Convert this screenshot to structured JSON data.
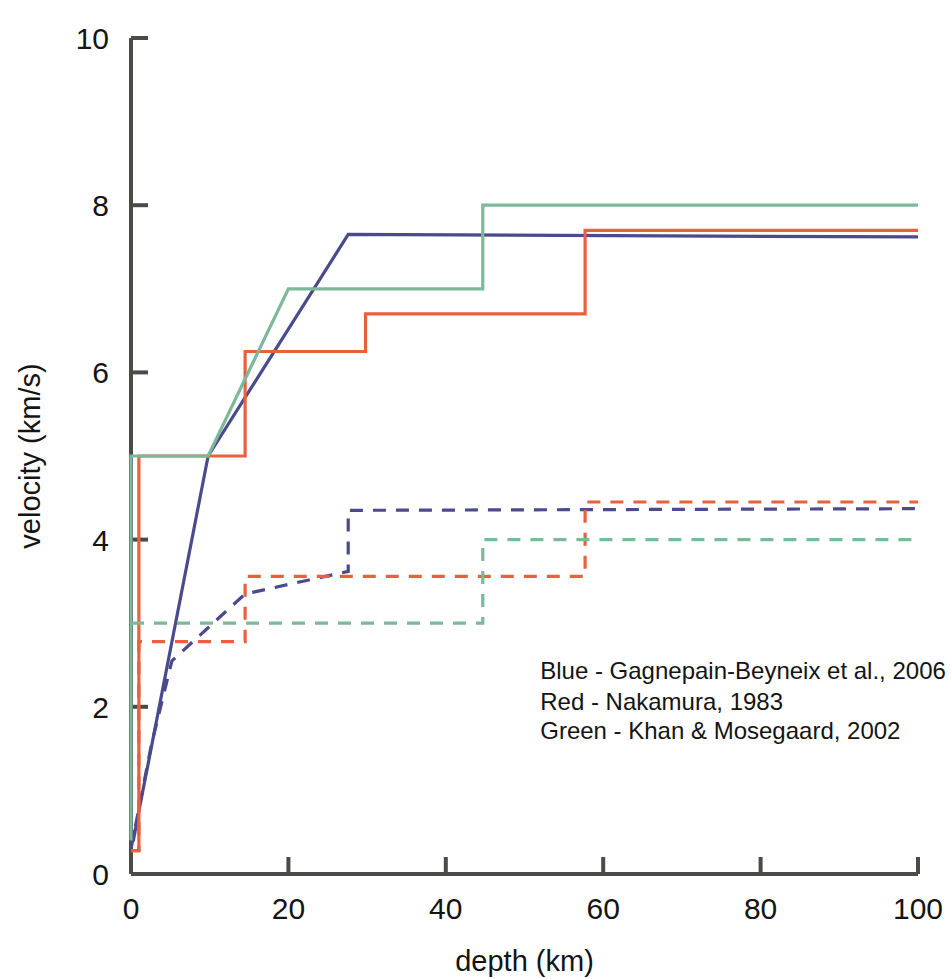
{
  "chart_data": {
    "type": "line",
    "title": "",
    "xlabel": "depth (km)",
    "ylabel": "velocity (km/s)",
    "xlim": [
      0,
      100
    ],
    "ylim": [
      0,
      10
    ],
    "xticks": [
      0,
      20,
      40,
      60,
      80,
      100
    ],
    "yticks": [
      0,
      2,
      4,
      6,
      8,
      10
    ],
    "xtick_labels": [
      "0",
      "20",
      "40",
      "60",
      "80",
      "100"
    ],
    "ytick_labels": [
      "0",
      "2",
      "4",
      "6",
      "8",
      "10"
    ],
    "grid": false,
    "legend_position": "inside-lower-right",
    "colors": {
      "blue": "#4a4a8c",
      "red": "#e8603c",
      "green": "#7cb899",
      "axis": "#4a4a46",
      "text": "#141414"
    },
    "annotations": [
      {
        "name": "legend-blue",
        "text": "Blue - Gagnepain-Beyneix et al., 2006",
        "color": "#4a4a8c",
        "x": 52,
        "y": 2.33
      },
      {
        "name": "legend-red",
        "text": "Red - Nakamura, 1983",
        "color": "#e8603c",
        "x": 52,
        "y": 1.96
      },
      {
        "name": "legend-green",
        "text": "Green - Khan & Mosegaard, 2002",
        "color": "#7cb899",
        "x": 52,
        "y": 1.62
      }
    ],
    "series": [
      {
        "name": "Gagnepain-Beyneix et al., 2006 (P-wave)",
        "short": "blue-p-solid",
        "color": "#4a4a8c",
        "dash": "solid",
        "width": 3.2,
        "points": [
          [
            0,
            0.55
          ],
          [
            0.4,
            0.45
          ],
          [
            1,
            0.75
          ],
          [
            9.8,
            5.0
          ],
          [
            27.6,
            7.65
          ],
          [
            27.6,
            7.65
          ],
          [
            100,
            7.62
          ]
        ]
      },
      {
        "name": "Gagnepain-Beyneix et al., 2006 (S-wave)",
        "short": "blue-s-dashed",
        "color": "#4a4a8c",
        "dash": "dashed",
        "width": 3.2,
        "points": [
          [
            0,
            0.3
          ],
          [
            2.6,
            1.55
          ],
          [
            5.2,
            2.55
          ],
          [
            14.5,
            3.35
          ],
          [
            27.6,
            3.62
          ],
          [
            27.6,
            4.35
          ],
          [
            100,
            4.37
          ]
        ]
      },
      {
        "name": "Nakamura, 1983 (P-wave)",
        "short": "red-p-solid",
        "color": "#e8603c",
        "dash": "solid",
        "width": 3.2,
        "points": [
          [
            0,
            0.28
          ],
          [
            1.0,
            0.28
          ],
          [
            1.0,
            5.0
          ],
          [
            14.5,
            5.0
          ],
          [
            14.5,
            6.25
          ],
          [
            29.8,
            6.25
          ],
          [
            29.8,
            6.7
          ],
          [
            57.7,
            6.7
          ],
          [
            57.7,
            7.7
          ],
          [
            100,
            7.7
          ]
        ]
      },
      {
        "name": "Nakamura, 1983 (S-wave)",
        "short": "red-s-dashed",
        "color": "#e8603c",
        "dash": "dashed",
        "width": 3.2,
        "points": [
          [
            0,
            0.28
          ],
          [
            1.0,
            0.28
          ],
          [
            1.0,
            2.78
          ],
          [
            14.5,
            2.78
          ],
          [
            14.5,
            3.56
          ],
          [
            57.7,
            3.56
          ],
          [
            57.7,
            4.45
          ],
          [
            100,
            4.45
          ]
        ]
      },
      {
        "name": "Khan & Mosegaard, 2002 (P-wave)",
        "short": "green-p-solid",
        "color": "#7cb899",
        "dash": "solid",
        "width": 3.2,
        "points": [
          [
            0,
            0.4
          ],
          [
            0,
            5.0
          ],
          [
            1.6,
            5.0
          ],
          [
            9.8,
            5.0
          ],
          [
            20.0,
            7.0
          ],
          [
            44.7,
            7.0
          ],
          [
            44.7,
            8.0
          ],
          [
            100,
            8.0
          ]
        ]
      },
      {
        "name": "Khan & Mosegaard, 2002 (S-wave)",
        "short": "green-s-dashed",
        "color": "#7cb899",
        "dash": "dashed",
        "width": 3.2,
        "points": [
          [
            0,
            3.0
          ],
          [
            44.7,
            3.0
          ],
          [
            44.7,
            4.0
          ],
          [
            100,
            4.0
          ]
        ]
      }
    ]
  }
}
